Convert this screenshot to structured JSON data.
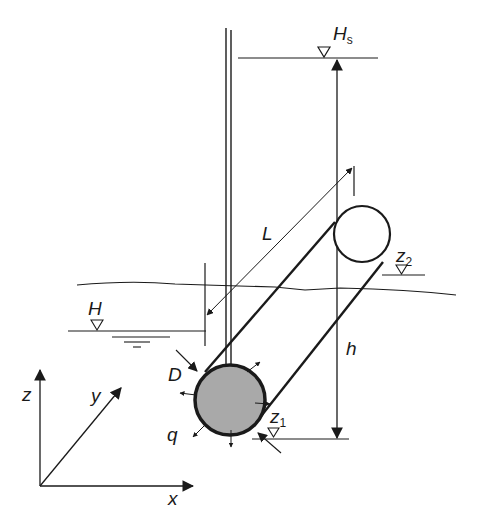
{
  "diagram": {
    "type": "well-drain-pipe-schematic",
    "labels": {
      "Hs": {
        "main": "H",
        "sub": "s"
      },
      "L": "L",
      "z2": {
        "main": "z",
        "sub": "2"
      },
      "H": "H",
      "h": "h",
      "D": "D",
      "q": "q",
      "z1": {
        "main": "z",
        "sub": "1"
      },
      "axis_z": "z",
      "axis_y": "y",
      "axis_x": "x"
    },
    "colors": {
      "line": "#1a1a1a",
      "pipe_fill": "#a9a9a9",
      "background": "#ffffff"
    }
  }
}
